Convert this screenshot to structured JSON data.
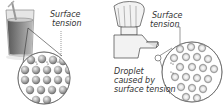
{
  "left_panel": {
    "subject": "glass of water",
    "label": {
      "line1": "Surface",
      "line2": "tension"
    }
  },
  "right_panel": {
    "subject": "tap",
    "label_top": {
      "line1": "Surface",
      "line2": "tension"
    },
    "label_bottom": {
      "line1": "Droplet",
      "line2": "caused by",
      "line3": "surface tension"
    }
  },
  "colors": {
    "ink": "#333333",
    "glass": "#9a9a9a",
    "water": "#6e6e6e",
    "molecule": "#8c8c8c",
    "background": "#ffffff"
  }
}
